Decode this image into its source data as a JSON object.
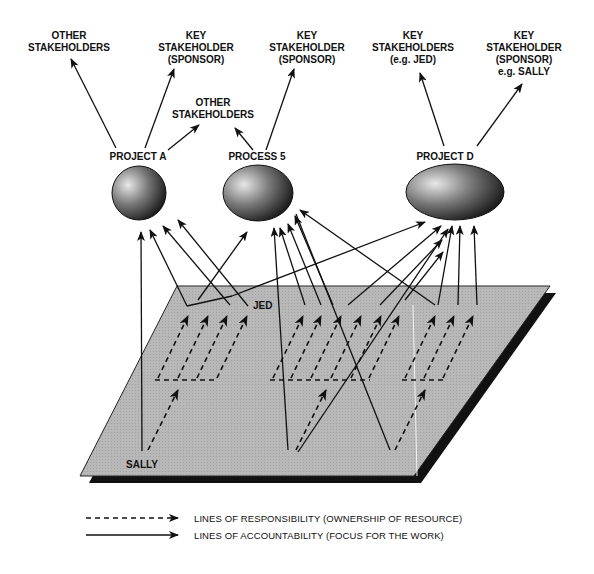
{
  "stakeholders": {
    "project_a_other": [
      "OTHER",
      "STAKEHOLDERS"
    ],
    "project_a_key": [
      "KEY",
      "STAKEHOLDER",
      "(SPONSOR)"
    ],
    "shared_other": [
      "OTHER",
      "STAKEHOLDERS"
    ],
    "process5_key": [
      "KEY",
      "STAKEHOLDER",
      "(SPONSOR)"
    ],
    "project_d_key_jed": [
      "KEY",
      "STAKEHOLDERS",
      "(e.g. JED)"
    ],
    "project_d_key_sally": [
      "KEY",
      "STAKEHOLDER",
      "(SPONSOR)",
      "e.g. SALLY"
    ]
  },
  "nodes": [
    {
      "id": "project-a",
      "label": "PROJECT A"
    },
    {
      "id": "process-5",
      "label": "PROCESS 5"
    },
    {
      "id": "project-d",
      "label": "PROJECT D"
    }
  ],
  "people": {
    "jed": "JED",
    "sally": "SALLY"
  },
  "legend": {
    "responsibility": "LINES OF RESPONSIBILITY  (OWNERSHIP OF RESOURCE)",
    "accountability": "LINES OF ACCOUNTABILITY  (FOCUS FOR THE WORK)"
  },
  "colors": {
    "plane": "#b4b4b4",
    "plane_shadow": "#111111",
    "line": "#111111"
  }
}
